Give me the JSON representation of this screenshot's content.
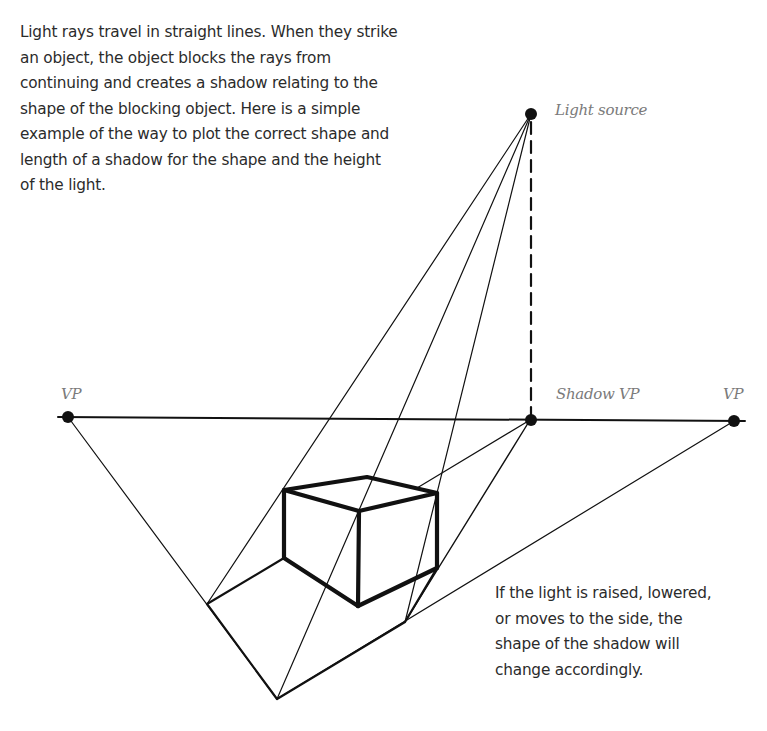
{
  "intro_text": "Light rays travel in straight lines. When they strike\nan object, the object blocks the rays from\ncontinuing and creates a shadow relating to the\nshape of the blocking object. Here is a simple\nexample of the way to plot the correct shape and\nlength of a shadow for the shape and the height\nof the light.",
  "note_text": "If the light is raised, lowered,\nor moves to the side, the\nshape of the shadow will\nchange accordingly.",
  "labels": {
    "light_source": "Light source",
    "vp_left": "VP",
    "shadow_vp": "Shadow VP",
    "vp_right": "VP"
  },
  "colors": {
    "ink": "#111111",
    "text": "#2b2b2b",
    "label": "#7a7a7a"
  }
}
